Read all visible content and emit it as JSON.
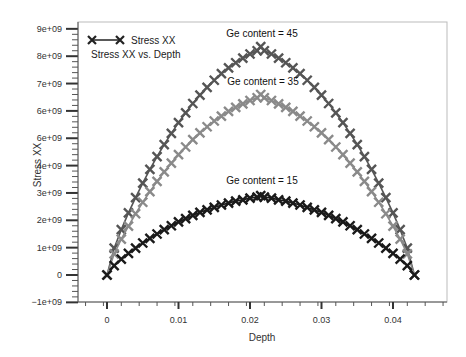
{
  "chart_data": {
    "type": "line",
    "title": "Stress XX vs. Depth",
    "xlabel": "Depth",
    "ylabel": "Stress XX",
    "xlim": [
      -0.0035,
      0.0475
    ],
    "ylim": [
      -1000000000.0,
      9200000000.0
    ],
    "x_ticks": [
      0,
      0.01,
      0.02,
      0.03,
      0.04
    ],
    "x_tick_labels": [
      "0",
      "0.01",
      "0.02",
      "0.03",
      "0.04"
    ],
    "y_ticks": [
      9000000000.0,
      8000000000.0,
      7000000000.0,
      6000000000.0,
      5000000000.0,
      4000000000.0,
      3000000000.0,
      2000000000.0,
      1000000000.0,
      0,
      -1000000000.0
    ],
    "y_tick_labels": [
      "9e+09",
      "8e+09",
      "7e+09",
      "6e+09",
      "6e+09",
      "4e+09",
      "3e+09",
      "2e+09",
      "1e+09",
      "0",
      "−1e+09"
    ],
    "grid": false,
    "legend": {
      "position": "top-left",
      "entries": [
        "Stress XX"
      ],
      "subtitle": "Stress XX vs. Depth",
      "marker": "x"
    },
    "annotations": [
      {
        "text": "Ge content = 45",
        "x": 0.0215,
        "y": 8750000000.0
      },
      {
        "text": "Ge content = 35",
        "x": 0.0215,
        "y": 7200000000.0
      },
      {
        "text": "Ge content = 15",
        "x": 0.0215,
        "y": 3250000000.0
      }
    ],
    "x": [
      0,
      0.001,
      0.002,
      0.003,
      0.004,
      0.005,
      0.006,
      0.007,
      0.008,
      0.009,
      0.01,
      0.011,
      0.012,
      0.013,
      0.014,
      0.015,
      0.016,
      0.017,
      0.018,
      0.019,
      0.02,
      0.021,
      0.0215,
      0.022,
      0.023,
      0.024,
      0.025,
      0.026,
      0.027,
      0.028,
      0.029,
      0.03,
      0.031,
      0.032,
      0.033,
      0.034,
      0.035,
      0.036,
      0.037,
      0.038,
      0.039,
      0.04,
      0.041,
      0.042,
      0.043
    ],
    "series": [
      {
        "name": "Ge content = 45",
        "color": "#555555",
        "values": [
          0,
          980000000.0,
          1660000000.0,
          2270000000.0,
          2830000000.0,
          3360000000.0,
          3860000000.0,
          4330000000.0,
          4770000000.0,
          5180000000.0,
          5570000000.0,
          5930000000.0,
          6270000000.0,
          6580000000.0,
          6860000000.0,
          7120000000.0,
          7360000000.0,
          7570000000.0,
          7760000000.0,
          7930000000.0,
          8080000000.0,
          8200000000.0,
          8350000000.0,
          8200000000.0,
          8080000000.0,
          7930000000.0,
          7760000000.0,
          7570000000.0,
          7360000000.0,
          7120000000.0,
          6860000000.0,
          6580000000.0,
          6270000000.0,
          5930000000.0,
          5570000000.0,
          5180000000.0,
          4770000000.0,
          4330000000.0,
          3860000000.0,
          3360000000.0,
          2830000000.0,
          2270000000.0,
          1660000000.0,
          980000000.0,
          0
        ]
      },
      {
        "name": "Ge content = 35",
        "color": "#8a8a8a",
        "values": [
          0,
          770000000.0,
          1310000000.0,
          1790000000.0,
          2240000000.0,
          2660000000.0,
          3050000000.0,
          3420000000.0,
          3770000000.0,
          4090000000.0,
          4400000000.0,
          4680000000.0,
          4950000000.0,
          5200000000.0,
          5420000000.0,
          5630000000.0,
          5810000000.0,
          5980000000.0,
          6130000000.0,
          6260000000.0,
          6380000000.0,
          6480000000.0,
          6600000000.0,
          6480000000.0,
          6380000000.0,
          6260000000.0,
          6130000000.0,
          5980000000.0,
          5810000000.0,
          5630000000.0,
          5420000000.0,
          5200000000.0,
          4950000000.0,
          4680000000.0,
          4400000000.0,
          4090000000.0,
          3770000000.0,
          3420000000.0,
          3050000000.0,
          2660000000.0,
          2240000000.0,
          1790000000.0,
          1310000000.0,
          770000000.0,
          0
        ]
      },
      {
        "name": "Ge content = 15",
        "color": "#1a1a1a",
        "values": [
          0,
          340000000.0,
          580000000.0,
          790000000.0,
          980000000.0,
          1170000000.0,
          1340000000.0,
          1500000000.0,
          1660000000.0,
          1800000000.0,
          1940000000.0,
          2060000000.0,
          2180000000.0,
          2290000000.0,
          2380000000.0,
          2470000000.0,
          2560000000.0,
          2630000000.0,
          2700000000.0,
          2750000000.0,
          2810000000.0,
          2850000000.0,
          2900000000.0,
          2850000000.0,
          2810000000.0,
          2750000000.0,
          2700000000.0,
          2630000000.0,
          2560000000.0,
          2470000000.0,
          2380000000.0,
          2290000000.0,
          2180000000.0,
          2060000000.0,
          1940000000.0,
          1800000000.0,
          1660000000.0,
          1500000000.0,
          1340000000.0,
          1170000000.0,
          980000000.0,
          790000000.0,
          580000000.0,
          340000000.0,
          0
        ]
      }
    ]
  },
  "legend": {
    "label": "Stress XX",
    "subtitle": "Stress XX vs. Depth"
  },
  "axes": {
    "xlabel": "Depth",
    "ylabel": "Stress XX"
  },
  "annotations": {
    "ge45": "Ge content = 45",
    "ge35": "Ge content = 35",
    "ge15": "Ge content = 15"
  }
}
